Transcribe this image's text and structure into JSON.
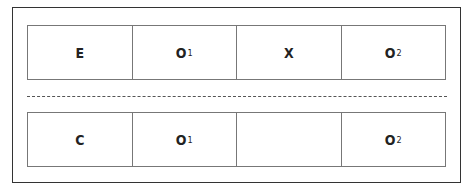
{
  "diagram": {
    "type": "research-design",
    "groups": [
      {
        "name": "experimental",
        "cells": [
          {
            "main": "E",
            "sub": ""
          },
          {
            "main": "O",
            "sub": "1"
          },
          {
            "main": "X",
            "sub": ""
          },
          {
            "main": "O",
            "sub": "2"
          }
        ]
      },
      {
        "name": "control",
        "cells": [
          {
            "main": "C",
            "sub": ""
          },
          {
            "main": "O",
            "sub": "1"
          },
          {
            "main": "",
            "sub": ""
          },
          {
            "main": "O",
            "sub": "2"
          }
        ]
      }
    ],
    "separator": "dashed"
  }
}
